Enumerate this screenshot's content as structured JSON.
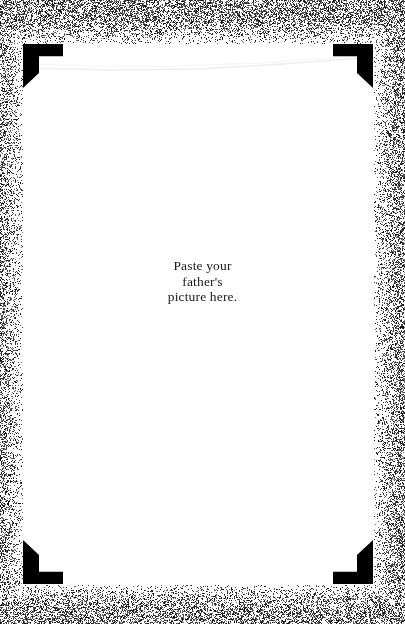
{
  "page": {
    "kind": "scrapbook-photo-page",
    "background_color": "#ffffff",
    "page_color": "#ffffff",
    "ink_color": "#000000",
    "grain_color": "#000000"
  },
  "caption": {
    "name": "paste-instruction",
    "lines": [
      "Paste your",
      "father's",
      "picture here."
    ],
    "full_text": "Paste your father's picture here.",
    "align": "center"
  },
  "corner_mounts": [
    {
      "position": "top-left",
      "name": "photo-corner-mount-top-left",
      "color": "#000000"
    },
    {
      "position": "top-right",
      "name": "photo-corner-mount-top-right",
      "color": "#000000"
    },
    {
      "position": "bottom-left",
      "name": "photo-corner-mount-bottom-left",
      "color": "#000000"
    },
    {
      "position": "bottom-right",
      "name": "photo-corner-mount-bottom-right",
      "color": "#000000"
    }
  ],
  "decor": {
    "grain_border": "speckled-scan-grain-border",
    "page_edge_line": "faint-slanted-paper-edge-line"
  }
}
